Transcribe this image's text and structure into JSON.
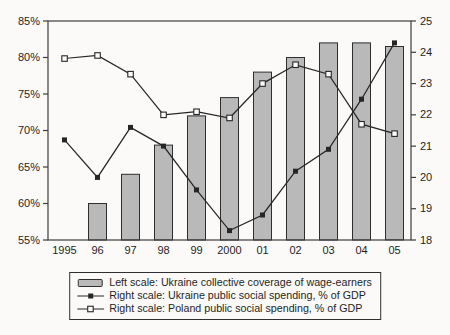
{
  "style": {
    "background": "#fbfaf8",
    "ink": "#1f1f1f",
    "bar_fill": "#b9b9b9",
    "bar_stroke": "#2e2e2e",
    "line_color": "#262626",
    "open_marker_fill": "#fcfcfb",
    "frame_color": "#3d3d3d"
  },
  "chart_data": {
    "type": "bar+line combo",
    "title": "",
    "categories": [
      "1995",
      "96",
      "97",
      "98",
      "99",
      "2000",
      "01",
      "02",
      "03",
      "04",
      "05"
    ],
    "series": [
      {
        "name": "Left scale: Ukraine collective coverage of wage-earners",
        "type": "bar",
        "axis": "left",
        "values": [
          null,
          60,
          64,
          68,
          72,
          74.5,
          78,
          80,
          82,
          82,
          81.5
        ]
      },
      {
        "name": "Right scale: Ukraine public social spending, % of GDP",
        "type": "line",
        "axis": "right",
        "marker": "filled-square",
        "values": [
          21.2,
          20.0,
          21.6,
          21.0,
          19.6,
          18.3,
          18.8,
          20.2,
          20.9,
          22.5,
          24.3
        ]
      },
      {
        "name": "Right scale: Poland public social spending, % of GDP",
        "type": "line",
        "axis": "right",
        "marker": "open-square",
        "values": [
          23.8,
          23.9,
          23.3,
          22.0,
          22.1,
          21.9,
          23.0,
          23.6,
          23.3,
          21.7,
          21.4
        ]
      }
    ],
    "left_axis": {
      "min": 55,
      "max": 85,
      "tick_step": 5,
      "tick_labels": [
        "85%",
        "80%",
        "75%",
        "70%",
        "65%",
        "60%",
        "55%"
      ]
    },
    "right_axis": {
      "min": 18,
      "max": 25,
      "tick_step": 1,
      "tick_labels": [
        "25",
        "24",
        "23",
        "22",
        "21",
        "20",
        "19",
        "18"
      ]
    },
    "grid": false,
    "legend_position": "bottom"
  }
}
